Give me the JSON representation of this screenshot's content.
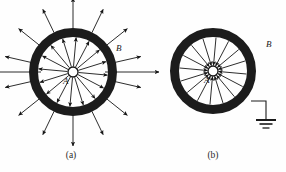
{
  "figure": {
    "background_color": "#fefefe",
    "ink_color": "#1a1a1a",
    "panels": [
      {
        "id": "a",
        "caption": "(a)",
        "caption_x": 71,
        "caption_y": 158,
        "description": "Isolated charged ring: field lines point radially outward on both inside and outside",
        "center_x": 73,
        "center_y": 72,
        "ring_inner_radius": 35,
        "ring_outer_radius": 44,
        "ring_thickness": 9,
        "hub_radius": 5.0,
        "hub_label": "A",
        "hub_label_x": 63,
        "hub_label_y": 84,
        "outer_label": "B",
        "outer_label_x": 116,
        "outer_label_y": 51,
        "field_direction": "outward",
        "inner_arrow_count": 16,
        "outer_arrow_count": 14,
        "outer_arrow_length": 26,
        "grounded": false
      },
      {
        "id": "b",
        "caption": "(b)",
        "caption_x": 213,
        "caption_y": 158,
        "description": "Grounded charged ring: external field vanishes, internal field lines point inward toward the hub",
        "center_x": 213,
        "center_y": 71,
        "ring_inner_radius": 34,
        "ring_outer_radius": 43,
        "ring_thickness": 9,
        "hub_radius": 5.0,
        "hub_label": "A",
        "hub_label_x": 204,
        "hub_label_y": 83,
        "outer_label": "B",
        "outer_label_x": 266,
        "outer_label_y": 47,
        "field_direction": "inward",
        "inner_arrow_count": 16,
        "outer_arrow_count": 0,
        "outer_arrow_length": 0,
        "grounded": true,
        "ground": {
          "attach_x": 251,
          "attach_y": 101,
          "corner_x": 266,
          "corner_y": 101,
          "stem_bottom_y": 120,
          "bar_widths": [
            20,
            13,
            7
          ],
          "bar_gap": 4,
          "bar_thicknesses": [
            2.0,
            1.6,
            1.3
          ]
        }
      }
    ]
  }
}
